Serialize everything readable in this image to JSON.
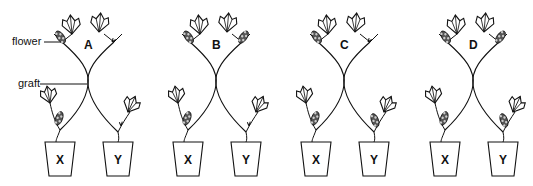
{
  "labels": {
    "flower": "flower",
    "graft": "graft"
  },
  "panels": [
    {
      "id": "A",
      "center_x": 88,
      "top_left_flowering": true,
      "top_right_flowering": false,
      "x_flowering": true,
      "y_flowering": false,
      "pot_x": "X",
      "pot_y": "Y"
    },
    {
      "id": "B",
      "center_x": 216,
      "top_left_flowering": true,
      "top_right_flowering": true,
      "x_flowering": true,
      "y_flowering": false,
      "pot_x": "X",
      "pot_y": "Y"
    },
    {
      "id": "C",
      "center_x": 344,
      "top_left_flowering": true,
      "top_right_flowering": false,
      "x_flowering": true,
      "y_flowering": true,
      "pot_x": "X",
      "pot_y": "Y"
    },
    {
      "id": "D",
      "center_x": 473,
      "top_left_flowering": true,
      "top_right_flowering": true,
      "x_flowering": true,
      "y_flowering": true,
      "pot_x": "X",
      "pot_y": "Y"
    }
  ],
  "colors": {
    "ink": "#111111",
    "background": "#ffffff"
  }
}
